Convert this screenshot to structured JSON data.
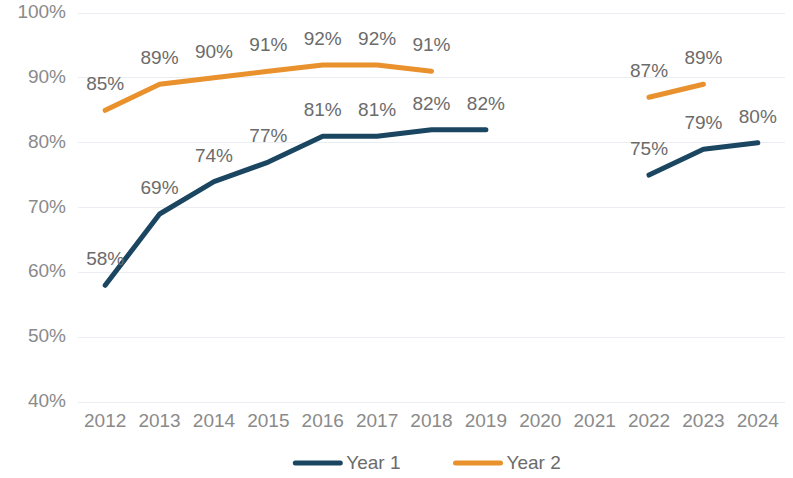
{
  "chart_data": {
    "type": "line",
    "title": "",
    "subtitle": "",
    "xlabel": "",
    "ylabel": "",
    "categories": [
      "2012",
      "2013",
      "2014",
      "2015",
      "2016",
      "2017",
      "2018",
      "2019",
      "2020",
      "2021",
      "2022",
      "2023",
      "2024"
    ],
    "ylim": [
      40,
      100
    ],
    "ytick_labels": [
      "100%",
      "90%",
      "80%",
      "70%",
      "60%",
      "50%",
      "40%"
    ],
    "ytick_values": [
      100,
      90,
      80,
      70,
      60,
      50,
      40
    ],
    "grid": "horizontal",
    "legend_position": "bottom",
    "series": [
      {
        "name": "Year 1",
        "color": "#1a4661",
        "values": [
          58,
          69,
          74,
          77,
          81,
          81,
          82,
          82,
          null,
          null,
          75,
          79,
          80
        ],
        "labels": [
          "58%",
          "69%",
          "74%",
          "77%",
          "81%",
          "81%",
          "82%",
          "82%",
          "",
          "",
          "75%",
          "79%",
          "80%"
        ]
      },
      {
        "name": "Year 2",
        "color": "#e8912d",
        "values": [
          85,
          89,
          90,
          91,
          92,
          92,
          91,
          null,
          null,
          null,
          87,
          89,
          null
        ],
        "labels": [
          "85%",
          "89%",
          "90%",
          "91%",
          "92%",
          "92%",
          "91%",
          "",
          "",
          "",
          "87%",
          "89%",
          ""
        ]
      }
    ]
  },
  "legend": {
    "items": [
      {
        "label": "Year 1",
        "color": "#1a4661"
      },
      {
        "label": "Year 2",
        "color": "#e8912d"
      }
    ]
  },
  "colors": {
    "background": "#ffffff",
    "grid": "#eaedf1",
    "tick_text": "#8a8a8a",
    "label_text": "#6b6b6b",
    "series_1": "#1a4661",
    "series_2": "#e8912d"
  }
}
